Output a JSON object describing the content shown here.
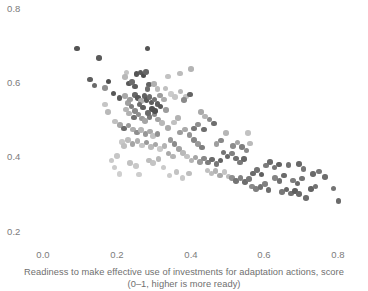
{
  "chart_data": {
    "type": "scatter",
    "title": "",
    "subtitle": "",
    "xlabel": "Readiness to make effective use of investments for adaptation actions, score",
    "xlabel_line2": "(0–1, higher is more ready)",
    "ylabel": "",
    "xlim": [
      0.0,
      0.85
    ],
    "ylim": [
      0.2,
      0.8
    ],
    "xticks": [
      "0.0",
      "0.2",
      "0.4",
      "0.6",
      "0.8"
    ],
    "xtick_values": [
      0.0,
      0.2,
      0.4,
      0.6,
      0.8
    ],
    "yticks": [
      "0.8",
      "0.6",
      "0.4",
      "0.2"
    ],
    "ytick_values": [
      0.8,
      0.6,
      0.4,
      0.2
    ],
    "grid": false,
    "legend": "none",
    "marker_size_px": 5.6,
    "colors": {
      "dark": "#555555",
      "mid": "#8f8f8f",
      "light": "#c9c9c9",
      "background": "#ffffff",
      "text": "#7b7b7b"
    },
    "points": [
      {
        "x": 0.093,
        "y": 0.694,
        "c": "#545454"
      },
      {
        "x": 0.152,
        "y": 0.668,
        "c": "#5a5a5a"
      },
      {
        "x": 0.283,
        "y": 0.694,
        "c": "#545454"
      },
      {
        "x": 0.128,
        "y": 0.611,
        "c": "#5e5e5e"
      },
      {
        "x": 0.14,
        "y": 0.594,
        "c": "#6a6a6a"
      },
      {
        "x": 0.178,
        "y": 0.605,
        "c": "#4f4f4f"
      },
      {
        "x": 0.226,
        "y": 0.629,
        "c": "#c4c4c4"
      },
      {
        "x": 0.254,
        "y": 0.625,
        "c": "#555555"
      },
      {
        "x": 0.264,
        "y": 0.629,
        "c": "#5a5a5a"
      },
      {
        "x": 0.272,
        "y": 0.621,
        "c": "#4d4d4d"
      },
      {
        "x": 0.279,
        "y": 0.631,
        "c": "#666666"
      },
      {
        "x": 0.233,
        "y": 0.6,
        "c": "#585858"
      },
      {
        "x": 0.241,
        "y": 0.603,
        "c": "#6b6b6b"
      },
      {
        "x": 0.25,
        "y": 0.592,
        "c": "#5d5d5d"
      },
      {
        "x": 0.287,
        "y": 0.597,
        "c": "#636363"
      },
      {
        "x": 0.283,
        "y": 0.585,
        "c": "#6e6e6e"
      },
      {
        "x": 0.191,
        "y": 0.573,
        "c": "#575757"
      },
      {
        "x": 0.207,
        "y": 0.56,
        "c": "#5c5c5c"
      },
      {
        "x": 0.222,
        "y": 0.566,
        "c": "#a8a8a8"
      },
      {
        "x": 0.23,
        "y": 0.548,
        "c": "#a0a0a0"
      },
      {
        "x": 0.236,
        "y": 0.557,
        "c": "#9b9b9b"
      },
      {
        "x": 0.249,
        "y": 0.569,
        "c": "#676767"
      },
      {
        "x": 0.257,
        "y": 0.56,
        "c": "#585858"
      },
      {
        "x": 0.266,
        "y": 0.553,
        "c": "#adadad"
      },
      {
        "x": 0.275,
        "y": 0.566,
        "c": "#626262"
      },
      {
        "x": 0.281,
        "y": 0.556,
        "c": "#575757"
      },
      {
        "x": 0.289,
        "y": 0.563,
        "c": "#6d6d6d"
      },
      {
        "x": 0.294,
        "y": 0.549,
        "c": "#5b5b5b"
      },
      {
        "x": 0.302,
        "y": 0.557,
        "c": "#737373"
      },
      {
        "x": 0.311,
        "y": 0.545,
        "c": "#5f5f5f"
      },
      {
        "x": 0.319,
        "y": 0.538,
        "c": "#585858"
      },
      {
        "x": 0.296,
        "y": 0.531,
        "c": "#505050"
      },
      {
        "x": 0.339,
        "y": 0.619,
        "c": "#c2c2c2"
      },
      {
        "x": 0.372,
        "y": 0.627,
        "c": "#bcbcbc"
      },
      {
        "x": 0.401,
        "y": 0.638,
        "c": "#b4b4b4"
      },
      {
        "x": 0.332,
        "y": 0.586,
        "c": "#c0c0c0"
      },
      {
        "x": 0.347,
        "y": 0.572,
        "c": "#cbcbcb"
      },
      {
        "x": 0.358,
        "y": 0.563,
        "c": "#c6c6c6"
      },
      {
        "x": 0.373,
        "y": 0.578,
        "c": "#b9b9b9"
      },
      {
        "x": 0.388,
        "y": 0.565,
        "c": "#c2c2c2"
      },
      {
        "x": 0.383,
        "y": 0.556,
        "c": "#8a8a8a"
      },
      {
        "x": 0.398,
        "y": 0.57,
        "c": "#646464"
      },
      {
        "x": 0.328,
        "y": 0.557,
        "c": "#adadad"
      },
      {
        "x": 0.318,
        "y": 0.567,
        "c": "#9d9d9d"
      },
      {
        "x": 0.225,
        "y": 0.53,
        "c": "#b5b5b5"
      },
      {
        "x": 0.234,
        "y": 0.519,
        "c": "#b2b2b2"
      },
      {
        "x": 0.247,
        "y": 0.508,
        "c": "#6f6f6f"
      },
      {
        "x": 0.259,
        "y": 0.516,
        "c": "#8d8d8d"
      },
      {
        "x": 0.268,
        "y": 0.505,
        "c": "#999999"
      },
      {
        "x": 0.277,
        "y": 0.499,
        "c": "#a5a5a5"
      },
      {
        "x": 0.289,
        "y": 0.509,
        "c": "#7a7a7a"
      },
      {
        "x": 0.302,
        "y": 0.516,
        "c": "#8b8b8b"
      },
      {
        "x": 0.312,
        "y": 0.503,
        "c": "#a2a2a2"
      },
      {
        "x": 0.322,
        "y": 0.493,
        "c": "#b8b8b8"
      },
      {
        "x": 0.195,
        "y": 0.497,
        "c": "#c0c0c0"
      },
      {
        "x": 0.209,
        "y": 0.488,
        "c": "#a6a6a6"
      },
      {
        "x": 0.219,
        "y": 0.479,
        "c": "#6b6b6b"
      },
      {
        "x": 0.232,
        "y": 0.487,
        "c": "#9a9a9a"
      },
      {
        "x": 0.244,
        "y": 0.476,
        "c": "#aeaeae"
      },
      {
        "x": 0.255,
        "y": 0.468,
        "c": "#8e8e8e"
      },
      {
        "x": 0.266,
        "y": 0.474,
        "c": "#b6b6b6"
      },
      {
        "x": 0.278,
        "y": 0.464,
        "c": "#979797"
      },
      {
        "x": 0.29,
        "y": 0.47,
        "c": "#a9a9a9"
      },
      {
        "x": 0.298,
        "y": 0.458,
        "c": "#c1c1c1"
      },
      {
        "x": 0.31,
        "y": 0.463,
        "c": "#919191"
      },
      {
        "x": 0.214,
        "y": 0.443,
        "c": "#c8c8c8"
      },
      {
        "x": 0.219,
        "y": 0.431,
        "c": "#c0c0c0"
      },
      {
        "x": 0.231,
        "y": 0.447,
        "c": "#bdbdbd"
      },
      {
        "x": 0.243,
        "y": 0.437,
        "c": "#a4a4a4"
      },
      {
        "x": 0.256,
        "y": 0.445,
        "c": "#b0b0b0"
      },
      {
        "x": 0.268,
        "y": 0.433,
        "c": "#c5c5c5"
      },
      {
        "x": 0.281,
        "y": 0.441,
        "c": "#999999"
      },
      {
        "x": 0.293,
        "y": 0.428,
        "c": "#bababa"
      },
      {
        "x": 0.305,
        "y": 0.436,
        "c": "#a7a7a7"
      },
      {
        "x": 0.318,
        "y": 0.424,
        "c": "#cacaca"
      },
      {
        "x": 0.33,
        "y": 0.432,
        "c": "#b3b3b3"
      },
      {
        "x": 0.2,
        "y": 0.405,
        "c": "#c6c6c6"
      },
      {
        "x": 0.186,
        "y": 0.392,
        "c": "#c9c9c9"
      },
      {
        "x": 0.194,
        "y": 0.374,
        "c": "#cccccc"
      },
      {
        "x": 0.236,
        "y": 0.386,
        "c": "#c1c1c1"
      },
      {
        "x": 0.253,
        "y": 0.378,
        "c": "#c8c8c8"
      },
      {
        "x": 0.288,
        "y": 0.393,
        "c": "#bdbdbd"
      },
      {
        "x": 0.299,
        "y": 0.385,
        "c": "#c4c4c4"
      },
      {
        "x": 0.313,
        "y": 0.396,
        "c": "#b8b8b8"
      },
      {
        "x": 0.327,
        "y": 0.374,
        "c": "#cacaca"
      },
      {
        "x": 0.34,
        "y": 0.411,
        "c": "#a9a9a9"
      },
      {
        "x": 0.352,
        "y": 0.403,
        "c": "#b5b5b5"
      },
      {
        "x": 0.346,
        "y": 0.447,
        "c": "#989898"
      },
      {
        "x": 0.357,
        "y": 0.437,
        "c": "#8b8b8b"
      },
      {
        "x": 0.369,
        "y": 0.424,
        "c": "#a2a2a2"
      },
      {
        "x": 0.38,
        "y": 0.413,
        "c": "#b9b9b9"
      },
      {
        "x": 0.391,
        "y": 0.403,
        "c": "#c3c3c3"
      },
      {
        "x": 0.372,
        "y": 0.468,
        "c": "#9d9d9d"
      },
      {
        "x": 0.385,
        "y": 0.476,
        "c": "#aaaaaa"
      },
      {
        "x": 0.397,
        "y": 0.461,
        "c": "#939393"
      },
      {
        "x": 0.409,
        "y": 0.448,
        "c": "#868686"
      },
      {
        "x": 0.42,
        "y": 0.437,
        "c": "#999999"
      },
      {
        "x": 0.431,
        "y": 0.427,
        "c": "#7e7e7e"
      },
      {
        "x": 0.409,
        "y": 0.479,
        "c": "#767676"
      },
      {
        "x": 0.42,
        "y": 0.489,
        "c": "#8f8f8f"
      },
      {
        "x": 0.436,
        "y": 0.476,
        "c": "#6e6e6e"
      },
      {
        "x": 0.403,
        "y": 0.393,
        "c": "#b4b4b4"
      },
      {
        "x": 0.414,
        "y": 0.401,
        "c": "#a5a5a5"
      },
      {
        "x": 0.425,
        "y": 0.389,
        "c": "#9a9a9a"
      },
      {
        "x": 0.437,
        "y": 0.398,
        "c": "#888888"
      },
      {
        "x": 0.448,
        "y": 0.387,
        "c": "#7c7c7c"
      },
      {
        "x": 0.459,
        "y": 0.395,
        "c": "#6a6a6a"
      },
      {
        "x": 0.47,
        "y": 0.383,
        "c": "#767676"
      },
      {
        "x": 0.481,
        "y": 0.392,
        "c": "#636363"
      },
      {
        "x": 0.446,
        "y": 0.366,
        "c": "#c0c0c0"
      },
      {
        "x": 0.457,
        "y": 0.357,
        "c": "#bcbcbc"
      },
      {
        "x": 0.468,
        "y": 0.364,
        "c": "#b3b3b3"
      },
      {
        "x": 0.48,
        "y": 0.352,
        "c": "#a9a9a9"
      },
      {
        "x": 0.492,
        "y": 0.361,
        "c": "#c4c4c4"
      },
      {
        "x": 0.503,
        "y": 0.349,
        "c": "#bbbbbb"
      },
      {
        "x": 0.489,
        "y": 0.414,
        "c": "#757575"
      },
      {
        "x": 0.5,
        "y": 0.403,
        "c": "#686868"
      },
      {
        "x": 0.512,
        "y": 0.411,
        "c": "#818181"
      },
      {
        "x": 0.523,
        "y": 0.398,
        "c": "#707070"
      },
      {
        "x": 0.534,
        "y": 0.387,
        "c": "#7a7a7a"
      },
      {
        "x": 0.545,
        "y": 0.396,
        "c": "#666666"
      },
      {
        "x": 0.516,
        "y": 0.432,
        "c": "#8c8c8c"
      },
      {
        "x": 0.528,
        "y": 0.441,
        "c": "#a5a5a5"
      },
      {
        "x": 0.54,
        "y": 0.428,
        "c": "#7e7e7e"
      },
      {
        "x": 0.552,
        "y": 0.419,
        "c": "#898989"
      },
      {
        "x": 0.561,
        "y": 0.438,
        "c": "#bababa"
      },
      {
        "x": 0.512,
        "y": 0.345,
        "c": "#8f8f8f"
      },
      {
        "x": 0.524,
        "y": 0.337,
        "c": "#747474"
      },
      {
        "x": 0.536,
        "y": 0.346,
        "c": "#828282"
      },
      {
        "x": 0.547,
        "y": 0.334,
        "c": "#6d6d6d"
      },
      {
        "x": 0.559,
        "y": 0.342,
        "c": "#787878"
      },
      {
        "x": 0.57,
        "y": 0.358,
        "c": "#6a6a6a"
      },
      {
        "x": 0.581,
        "y": 0.367,
        "c": "#737373"
      },
      {
        "x": 0.592,
        "y": 0.355,
        "c": "#606060"
      },
      {
        "x": 0.566,
        "y": 0.322,
        "c": "#8a8a8a"
      },
      {
        "x": 0.578,
        "y": 0.315,
        "c": "#7f7f7f"
      },
      {
        "x": 0.59,
        "y": 0.321,
        "c": "#727272"
      },
      {
        "x": 0.602,
        "y": 0.329,
        "c": "#808080"
      },
      {
        "x": 0.611,
        "y": 0.313,
        "c": "#6d6d6d"
      },
      {
        "x": 0.604,
        "y": 0.379,
        "c": "#7b7b7b"
      },
      {
        "x": 0.616,
        "y": 0.388,
        "c": "#6b6b6b"
      },
      {
        "x": 0.628,
        "y": 0.374,
        "c": "#757575"
      },
      {
        "x": 0.64,
        "y": 0.382,
        "c": "#626262"
      },
      {
        "x": 0.629,
        "y": 0.346,
        "c": "#848484"
      },
      {
        "x": 0.641,
        "y": 0.338,
        "c": "#707070"
      },
      {
        "x": 0.653,
        "y": 0.352,
        "c": "#6a6a6a"
      },
      {
        "x": 0.648,
        "y": 0.307,
        "c": "#787878"
      },
      {
        "x": 0.66,
        "y": 0.314,
        "c": "#666666"
      },
      {
        "x": 0.672,
        "y": 0.304,
        "c": "#717171"
      },
      {
        "x": 0.683,
        "y": 0.311,
        "c": "#5e5e5e"
      },
      {
        "x": 0.694,
        "y": 0.303,
        "c": "#6a6a6a"
      },
      {
        "x": 0.678,
        "y": 0.339,
        "c": "#7d7d7d"
      },
      {
        "x": 0.69,
        "y": 0.331,
        "c": "#6b6b6b"
      },
      {
        "x": 0.702,
        "y": 0.344,
        "c": "#747474"
      },
      {
        "x": 0.666,
        "y": 0.38,
        "c": "#717171"
      },
      {
        "x": 0.694,
        "y": 0.383,
        "c": "#676767"
      },
      {
        "x": 0.706,
        "y": 0.369,
        "c": "#767676"
      },
      {
        "x": 0.713,
        "y": 0.291,
        "c": "#6e6e6e"
      },
      {
        "x": 0.727,
        "y": 0.315,
        "c": "#636363"
      },
      {
        "x": 0.739,
        "y": 0.322,
        "c": "#727272"
      },
      {
        "x": 0.732,
        "y": 0.356,
        "c": "#6a6a6a"
      },
      {
        "x": 0.749,
        "y": 0.363,
        "c": "#787878"
      },
      {
        "x": 0.764,
        "y": 0.348,
        "c": "#6d6d6d"
      },
      {
        "x": 0.788,
        "y": 0.317,
        "c": "#747474"
      },
      {
        "x": 0.801,
        "y": 0.283,
        "c": "#6b6b6b"
      },
      {
        "x": 0.451,
        "y": 0.503,
        "c": "#8c8c8c"
      },
      {
        "x": 0.464,
        "y": 0.492,
        "c": "#6e6e6e"
      },
      {
        "x": 0.428,
        "y": 0.523,
        "c": "#a9a9a9"
      },
      {
        "x": 0.44,
        "y": 0.511,
        "c": "#b5b5b5"
      },
      {
        "x": 0.355,
        "y": 0.495,
        "c": "#c0c0c0"
      },
      {
        "x": 0.366,
        "y": 0.507,
        "c": "#b2b2b2"
      },
      {
        "x": 0.339,
        "y": 0.48,
        "c": "#aaaaaa"
      },
      {
        "x": 0.176,
        "y": 0.523,
        "c": "#b9b9b9"
      },
      {
        "x": 0.168,
        "y": 0.543,
        "c": "#c5c5c5"
      },
      {
        "x": 0.301,
        "y": 0.598,
        "c": "#b0b0b0"
      },
      {
        "x": 0.311,
        "y": 0.585,
        "c": "#bcbcbc"
      },
      {
        "x": 0.47,
        "y": 0.437,
        "c": "#9e9e9e"
      },
      {
        "x": 0.482,
        "y": 0.446,
        "c": "#888888"
      },
      {
        "x": 0.556,
        "y": 0.466,
        "c": "#c2c2c2"
      },
      {
        "x": 0.497,
        "y": 0.466,
        "c": "#b6b6b6"
      },
      {
        "x": 0.343,
        "y": 0.352,
        "c": "#cbcbcb"
      },
      {
        "x": 0.362,
        "y": 0.362,
        "c": "#c3c3c3"
      },
      {
        "x": 0.378,
        "y": 0.345,
        "c": "#c9c9c9"
      },
      {
        "x": 0.396,
        "y": 0.357,
        "c": "#bebebe"
      },
      {
        "x": 0.26,
        "y": 0.355,
        "c": "#cdcdcd"
      },
      {
        "x": 0.208,
        "y": 0.356,
        "c": "#cfcfcf"
      },
      {
        "x": 0.222,
        "y": 0.617,
        "c": "#b8b8b8"
      },
      {
        "x": 0.262,
        "y": 0.543,
        "c": "#6c6c6c"
      },
      {
        "x": 0.271,
        "y": 0.535,
        "c": "#5f5f5f"
      },
      {
        "x": 0.25,
        "y": 0.525,
        "c": "#888888"
      },
      {
        "x": 0.24,
        "y": 0.538,
        "c": "#7d7d7d"
      },
      {
        "x": 0.304,
        "y": 0.525,
        "c": "#4e4e4e"
      },
      {
        "x": 0.284,
        "y": 0.52,
        "c": "#6a6a6a"
      },
      {
        "x": 0.168,
        "y": 0.588,
        "c": "#909090"
      },
      {
        "x": 0.333,
        "y": 0.529,
        "c": "#9c9c9c"
      }
    ]
  },
  "axis": {
    "y_ticks": [
      {
        "label": "0.8",
        "top": 4
      },
      {
        "label": "0.6",
        "top": 78
      },
      {
        "label": "0.4",
        "top": 152
      },
      {
        "label": "0.2",
        "top": 227
      }
    ],
    "x_ticks": [
      {
        "label": "0.0",
        "left": 43
      },
      {
        "label": "0.2",
        "left": 117
      },
      {
        "label": "0.4",
        "left": 191
      },
      {
        "label": "0.6",
        "left": 264
      },
      {
        "label": "0.8",
        "left": 338
      }
    ]
  },
  "geometry": {
    "x0_px": 43,
    "x_scale_px_per_unit": 368.75,
    "y_unit_0_2_px": 232,
    "y_scale_px_per_unit": 371.5
  }
}
